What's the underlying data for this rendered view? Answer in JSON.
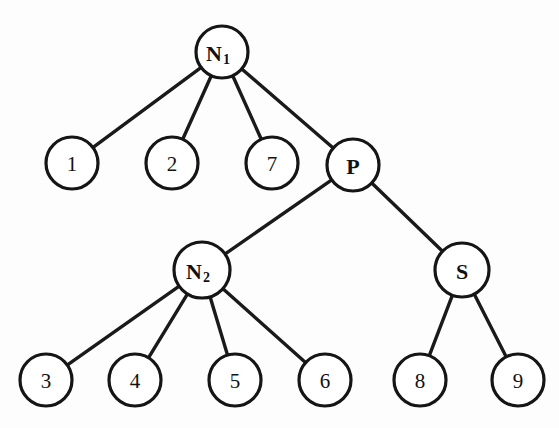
{
  "diagram": {
    "type": "tree",
    "background_color": "#fdfdfd",
    "stroke_color": "#151515",
    "fill_color": "#ffffff",
    "nodes": [
      {
        "id": "N1",
        "label": "N",
        "subscript": "1",
        "kind": "internal",
        "cx": 222,
        "cy": 52,
        "r": 26
      },
      {
        "id": "n1",
        "label": "1",
        "subscript": "",
        "kind": "leaf",
        "cx": 72,
        "cy": 163,
        "r": 26
      },
      {
        "id": "n2",
        "label": "2",
        "subscript": "",
        "kind": "leaf",
        "cx": 172,
        "cy": 163,
        "r": 26
      },
      {
        "id": "n7",
        "label": "7",
        "subscript": "",
        "kind": "leaf",
        "cx": 272,
        "cy": 163,
        "r": 26
      },
      {
        "id": "P",
        "label": "P",
        "subscript": "",
        "kind": "internal",
        "cx": 353,
        "cy": 165,
        "r": 26
      },
      {
        "id": "N2",
        "label": "N",
        "subscript": "2",
        "kind": "internal",
        "cx": 202,
        "cy": 270,
        "r": 28
      },
      {
        "id": "S",
        "label": "S",
        "subscript": "",
        "kind": "internal",
        "cx": 462,
        "cy": 270,
        "r": 27
      },
      {
        "id": "n3",
        "label": "3",
        "subscript": "",
        "kind": "leaf",
        "cx": 46,
        "cy": 380,
        "r": 26
      },
      {
        "id": "n4",
        "label": "4",
        "subscript": "",
        "kind": "leaf",
        "cx": 135,
        "cy": 380,
        "r": 26
      },
      {
        "id": "n5",
        "label": "5",
        "subscript": "",
        "kind": "leaf",
        "cx": 235,
        "cy": 380,
        "r": 26
      },
      {
        "id": "n6",
        "label": "6",
        "subscript": "",
        "kind": "leaf",
        "cx": 325,
        "cy": 380,
        "r": 26
      },
      {
        "id": "n8",
        "label": "8",
        "subscript": "",
        "kind": "leaf",
        "cx": 420,
        "cy": 380,
        "r": 26
      },
      {
        "id": "n9",
        "label": "9",
        "subscript": "",
        "kind": "leaf",
        "cx": 518,
        "cy": 380,
        "r": 26
      }
    ],
    "edges": [
      {
        "from": "N1",
        "to": "n1"
      },
      {
        "from": "N1",
        "to": "n2"
      },
      {
        "from": "N1",
        "to": "n7"
      },
      {
        "from": "N1",
        "to": "P"
      },
      {
        "from": "P",
        "to": "N2"
      },
      {
        "from": "P",
        "to": "S"
      },
      {
        "from": "N2",
        "to": "n3"
      },
      {
        "from": "N2",
        "to": "n4"
      },
      {
        "from": "N2",
        "to": "n5"
      },
      {
        "from": "N2",
        "to": "n6"
      },
      {
        "from": "S",
        "to": "n8"
      },
      {
        "from": "S",
        "to": "n9"
      }
    ]
  }
}
